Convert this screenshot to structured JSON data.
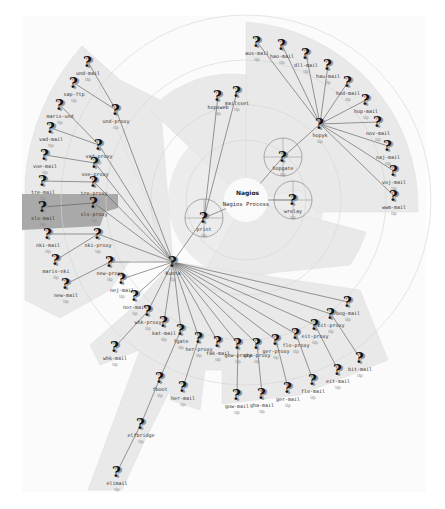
{
  "map": {
    "center": {
      "x": 246,
      "y": 200
    },
    "process": {
      "logo": "Nagios",
      "label": "Nagios Process"
    },
    "highlight_color": "#a9a9a9",
    "wedge_color": "#e8e8e8"
  },
  "nodes": [
    {
      "id": "print",
      "label": "print",
      "status": "Up",
      "x": 204,
      "y": 218,
      "circled": true
    },
    {
      "id": "hopgate",
      "label": "hopgate",
      "status": "Up",
      "x": 283,
      "y": 157,
      "circled": true
    },
    {
      "id": "wrelay",
      "label": "wrelay",
      "status": "Up",
      "x": 293,
      "y": 200,
      "circled": true
    },
    {
      "id": "hopsweb",
      "label": "hopsweb",
      "status": "Up",
      "x": 218,
      "y": 96
    },
    {
      "id": "mailsset",
      "label": "mailsset",
      "status": "Up",
      "x": 237,
      "y": 92
    },
    {
      "id": "hopyk",
      "label": "hopyk",
      "status": "Up",
      "x": 320,
      "y": 124
    },
    {
      "id": "aus-mail",
      "label": "aus-mail",
      "status": "Up",
      "x": 257,
      "y": 42
    },
    {
      "id": "hao-mail",
      "label": "hao-mail",
      "status": "Up",
      "x": 282,
      "y": 45
    },
    {
      "id": "dll-mail",
      "label": "dll-mail",
      "status": "Up",
      "x": 306,
      "y": 54
    },
    {
      "id": "hau-mail",
      "label": "hau-mail",
      "status": "Up",
      "x": 328,
      "y": 65
    },
    {
      "id": "hod-mail",
      "label": "hod-mail",
      "status": "Up",
      "x": 348,
      "y": 82
    },
    {
      "id": "hop-mail",
      "label": "hop-mail",
      "status": "Up",
      "x": 366,
      "y": 100
    },
    {
      "id": "nov-mail",
      "label": "nov-mail",
      "status": "Up",
      "x": 378,
      "y": 122
    },
    {
      "id": "naj-mail",
      "label": "naj-mail",
      "status": "Up",
      "x": 388,
      "y": 146
    },
    {
      "id": "voj-mail",
      "label": "voj-mail",
      "status": "Up",
      "x": 394,
      "y": 171
    },
    {
      "id": "wwm-mail",
      "label": "wwm-mail",
      "status": "Up",
      "x": 394,
      "y": 196
    },
    {
      "id": "kusta",
      "label": "Kusta",
      "status": "Up",
      "x": 173,
      "y": 262
    },
    {
      "id": "und-proxy",
      "label": "und-proxy",
      "status": "Up",
      "x": 116,
      "y": 110
    },
    {
      "id": "und-mail",
      "label": "und-mail",
      "status": "Up",
      "x": 88,
      "y": 62
    },
    {
      "id": "sap-ftp",
      "label": "sap-ftp",
      "status": "Up",
      "x": 74,
      "y": 83
    },
    {
      "id": "maris-und",
      "label": "maris-und",
      "status": "Up",
      "x": 60,
      "y": 105
    },
    {
      "id": "vad-mail",
      "label": "vad-mail",
      "status": "Up",
      "x": 51,
      "y": 128
    },
    {
      "id": "vad-proxy",
      "label": "vad-proxy",
      "status": "Up",
      "x": 99,
      "y": 145
    },
    {
      "id": "voe-mail",
      "label": "voe-mail",
      "status": "Up",
      "x": 45,
      "y": 155
    },
    {
      "id": "voe-proxy",
      "label": "voe-proxy",
      "status": "Up",
      "x": 95,
      "y": 163
    },
    {
      "id": "tre-mail",
      "label": "tre-mail",
      "status": "Up",
      "x": 43,
      "y": 181
    },
    {
      "id": "tre-proxy",
      "label": "tre-proxy",
      "status": "Up",
      "x": 94,
      "y": 182
    },
    {
      "id": "sls-mail",
      "label": "sls-mail",
      "status": "Up",
      "x": 43,
      "y": 207
    },
    {
      "id": "sls-proxy",
      "label": "sls-proxy",
      "status": "Up",
      "x": 94,
      "y": 203
    },
    {
      "id": "nki-mail",
      "label": "nki-mail",
      "status": "Up",
      "x": 48,
      "y": 234
    },
    {
      "id": "nki-proxy",
      "label": "nki-proxy",
      "status": "Up",
      "x": 98,
      "y": 234
    },
    {
      "id": "maris-nki",
      "label": "maris-nki",
      "status": "Up",
      "x": 56,
      "y": 260
    },
    {
      "id": "new-mail",
      "label": "new-mail",
      "status": "Up",
      "x": 66,
      "y": 284
    },
    {
      "id": "new-proxy",
      "label": "new-proxy",
      "status": "Up",
      "x": 110,
      "y": 262
    },
    {
      "id": "nej-mail",
      "label": "nej-mail",
      "status": "Up",
      "x": 122,
      "y": 279
    },
    {
      "id": "nor-mail",
      "label": "nor-mail",
      "status": "Up",
      "x": 135,
      "y": 296
    },
    {
      "id": "whk-proxy",
      "label": "whk-proxy",
      "status": "Up",
      "x": 148,
      "y": 311
    },
    {
      "id": "whk-mail",
      "label": "whk-mail",
      "status": "Up",
      "x": 115,
      "y": 347
    },
    {
      "id": "kat-mail",
      "label": "kat-mail",
      "status": "Up",
      "x": 164,
      "y": 322
    },
    {
      "id": "fgate",
      "label": "fgate",
      "status": "Up",
      "x": 181,
      "y": 330
    },
    {
      "id": "fboot",
      "label": "fboot",
      "status": "Up",
      "x": 160,
      "y": 378
    },
    {
      "id": "elfbridge",
      "label": "elfbridge",
      "status": "Up",
      "x": 141,
      "y": 424
    },
    {
      "id": "elimail",
      "label": "elimail",
      "status": "Up",
      "x": 117,
      "y": 472
    },
    {
      "id": "her-proxy",
      "label": "her-proxy",
      "status": "Up",
      "x": 199,
      "y": 338
    },
    {
      "id": "her-mail",
      "label": "her-mail",
      "status": "Up",
      "x": 183,
      "y": 387
    },
    {
      "id": "fak-mail",
      "label": "fak-mail",
      "status": "Up",
      "x": 218,
      "y": 342
    },
    {
      "id": "gow-proxy",
      "label": "gow-proxy",
      "status": "Up",
      "x": 238,
      "y": 344
    },
    {
      "id": "gow-mail",
      "label": "gow-mail",
      "status": "Up",
      "x": 237,
      "y": 395
    },
    {
      "id": "gha-proxy",
      "label": "gha-proxy",
      "status": "Up",
      "x": 257,
      "y": 344
    },
    {
      "id": "gha-mail",
      "label": "gha-mail",
      "status": "Up",
      "x": 262,
      "y": 394
    },
    {
      "id": "ger-proxy",
      "label": "ger-proxy",
      "status": "Up",
      "x": 276,
      "y": 340
    },
    {
      "id": "ger-mail",
      "label": "ger-mail",
      "status": "Up",
      "x": 288,
      "y": 388
    },
    {
      "id": "flo-proxy",
      "label": "flo-proxy",
      "status": "Up",
      "x": 296,
      "y": 334
    },
    {
      "id": "flo-mail",
      "label": "flo-mail",
      "status": "Up",
      "x": 313,
      "y": 380
    },
    {
      "id": "eit-proxy",
      "label": "eit-proxy",
      "status": "Up",
      "x": 315,
      "y": 325
    },
    {
      "id": "eit-mail",
      "label": "eit-mail",
      "status": "Up",
      "x": 338,
      "y": 370
    },
    {
      "id": "bit-proxy",
      "label": "bit-proxy",
      "status": "Up",
      "x": 331,
      "y": 314
    },
    {
      "id": "bit-mail",
      "label": "bit-mail",
      "status": "Up",
      "x": 360,
      "y": 358
    },
    {
      "id": "bog-mail",
      "label": "bog-mail",
      "status": "Up",
      "x": 348,
      "y": 302
    }
  ],
  "edges": [
    [
      "center",
      "print"
    ],
    [
      "center",
      "hopgate"
    ],
    [
      "center",
      "wrelay"
    ],
    [
      "print",
      "hopsweb"
    ],
    [
      "print",
      "mailsset"
    ],
    [
      "print",
      "kusta"
    ],
    [
      "hopgate",
      "hopyk"
    ],
    [
      "hopyk",
      "aus-mail"
    ],
    [
      "hopyk",
      "hao-mail"
    ],
    [
      "hopyk",
      "dll-mail"
    ],
    [
      "hopyk",
      "hau-mail"
    ],
    [
      "hopyk",
      "hod-mail"
    ],
    [
      "hopyk",
      "hop-mail"
    ],
    [
      "hopyk",
      "nov-mail"
    ],
    [
      "hopyk",
      "naj-mail"
    ],
    [
      "hopyk",
      "voj-mail"
    ],
    [
      "hopyk",
      "wwm-mail"
    ],
    [
      "kusta",
      "und-proxy"
    ],
    [
      "und-proxy",
      "und-mail"
    ],
    [
      "und-proxy",
      "sap-ftp"
    ],
    [
      "kusta",
      "vad-proxy"
    ],
    [
      "vad-proxy",
      "maris-und"
    ],
    [
      "vad-proxy",
      "vad-mail"
    ],
    [
      "kusta",
      "voe-proxy"
    ],
    [
      "voe-proxy",
      "voe-mail"
    ],
    [
      "kusta",
      "tre-proxy"
    ],
    [
      "tre-proxy",
      "tre-mail"
    ],
    [
      "kusta",
      "sls-proxy"
    ],
    [
      "sls-proxy",
      "sls-mail"
    ],
    [
      "kusta",
      "nki-proxy"
    ],
    [
      "nki-proxy",
      "nki-mail"
    ],
    [
      "nki-proxy",
      "maris-nki"
    ],
    [
      "kusta",
      "new-proxy"
    ],
    [
      "new-proxy",
      "new-mail"
    ],
    [
      "kusta",
      "nej-mail"
    ],
    [
      "kusta",
      "nor-mail"
    ],
    [
      "kusta",
      "whk-proxy"
    ],
    [
      "whk-proxy",
      "whk-mail"
    ],
    [
      "kusta",
      "kat-mail"
    ],
    [
      "kusta",
      "fgate"
    ],
    [
      "fgate",
      "fboot"
    ],
    [
      "fboot",
      "elfbridge"
    ],
    [
      "elfbridge",
      "elimail"
    ],
    [
      "kusta",
      "her-proxy"
    ],
    [
      "her-proxy",
      "her-mail"
    ],
    [
      "kusta",
      "fak-mail"
    ],
    [
      "kusta",
      "gow-proxy"
    ],
    [
      "gow-proxy",
      "gow-mail"
    ],
    [
      "kusta",
      "gha-proxy"
    ],
    [
      "gha-proxy",
      "gha-mail"
    ],
    [
      "kusta",
      "ger-proxy"
    ],
    [
      "ger-proxy",
      "ger-mail"
    ],
    [
      "kusta",
      "flo-proxy"
    ],
    [
      "flo-proxy",
      "flo-mail"
    ],
    [
      "kusta",
      "eit-proxy"
    ],
    [
      "eit-proxy",
      "eit-mail"
    ],
    [
      "kusta",
      "bit-proxy"
    ],
    [
      "bit-proxy",
      "bit-mail"
    ],
    [
      "kusta",
      "bog-mail"
    ]
  ],
  "icons": {
    "host": "question-mark-icon",
    "process": "nagios-logo-icon"
  }
}
